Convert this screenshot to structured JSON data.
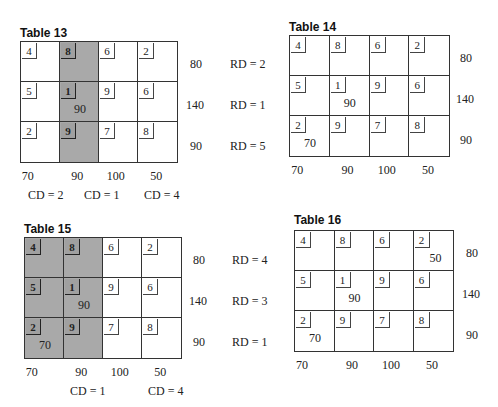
{
  "tables": [
    {
      "title": "Table 13",
      "costs": [
        [
          4,
          8,
          6,
          2
        ],
        [
          5,
          1,
          9,
          6
        ],
        [
          2,
          9,
          7,
          8
        ]
      ],
      "allocations": [
        [
          null,
          null,
          null,
          null
        ],
        [
          null,
          "90",
          null,
          null
        ],
        [
          null,
          null,
          null,
          null
        ]
      ],
      "shaded_columns": [
        1
      ],
      "supply": [
        "80",
        "140",
        "90"
      ],
      "demand": [
        "70",
        "90",
        "100",
        "50"
      ],
      "row_differences": [
        "RD = 2",
        "RD = 1",
        "RD = 5"
      ],
      "column_differences": [
        "CD = 2",
        "CD = 1",
        "CD = 4"
      ]
    },
    {
      "title": "Table 14",
      "costs": [
        [
          4,
          8,
          6,
          2
        ],
        [
          5,
          1,
          9,
          6
        ],
        [
          2,
          9,
          7,
          8
        ]
      ],
      "allocations": [
        [
          null,
          null,
          null,
          null
        ],
        [
          null,
          "90",
          null,
          null
        ],
        [
          "70",
          null,
          null,
          null
        ]
      ],
      "shaded_columns": [],
      "supply": [
        "80",
        "140",
        "90"
      ],
      "demand": [
        "70",
        "90",
        "100",
        "50"
      ],
      "row_differences": [],
      "column_differences": []
    },
    {
      "title": "Table 15",
      "costs": [
        [
          4,
          8,
          6,
          2
        ],
        [
          5,
          1,
          9,
          6
        ],
        [
          2,
          9,
          7,
          8
        ]
      ],
      "allocations": [
        [
          null,
          null,
          null,
          null
        ],
        [
          null,
          "90",
          null,
          null
        ],
        [
          "70",
          null,
          null,
          null
        ]
      ],
      "shaded_columns": [
        0,
        1
      ],
      "supply": [
        "80",
        "140",
        "90"
      ],
      "demand": [
        "70",
        "90",
        "100",
        "50"
      ],
      "row_differences": [
        "RD = 4",
        "RD = 3",
        "RD = 1"
      ],
      "column_differences": [
        "CD = 1",
        "CD = 4"
      ]
    },
    {
      "title": "Table 16",
      "costs": [
        [
          4,
          8,
          6,
          2
        ],
        [
          5,
          1,
          9,
          6
        ],
        [
          2,
          9,
          7,
          8
        ]
      ],
      "allocations": [
        [
          null,
          null,
          null,
          "50"
        ],
        [
          null,
          "90",
          null,
          null
        ],
        [
          "70",
          null,
          null,
          null
        ]
      ],
      "shaded_columns": [],
      "supply": [
        "80",
        "140",
        "90"
      ],
      "demand": [
        "70",
        "90",
        "100",
        "50"
      ],
      "row_differences": [],
      "column_differences": []
    }
  ],
  "colors": {
    "shade": "#a9a9a9",
    "line": "#333333"
  }
}
